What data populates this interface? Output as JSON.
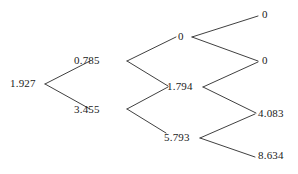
{
  "diagram": {
    "type": "binary-tree",
    "background_color": "#ffffff",
    "line_color": "#2a2a2a",
    "text_color": "#1a1a1a",
    "width": 298,
    "height": 174,
    "nodes": [
      {
        "id": "root",
        "label": "1.927",
        "x": 10,
        "y": 78,
        "anchor": "left",
        "depth": 0
      },
      {
        "id": "n1",
        "label": "0.785",
        "x": 74,
        "y": 55,
        "anchor": "left",
        "depth": 1
      },
      {
        "id": "n2",
        "label": "3.455",
        "x": 74,
        "y": 104,
        "anchor": "left",
        "depth": 1
      },
      {
        "id": "n3",
        "label": "0",
        "x": 178,
        "y": 31,
        "anchor": "left",
        "depth": 2
      },
      {
        "id": "n4",
        "label": "1.794",
        "x": 167,
        "y": 81,
        "anchor": "left",
        "depth": 2
      },
      {
        "id": "n5",
        "label": "5.793",
        "x": 164,
        "y": 132,
        "anchor": "left",
        "depth": 2
      },
      {
        "id": "l1",
        "label": "0",
        "x": 262,
        "y": 9,
        "anchor": "left",
        "depth": 3
      },
      {
        "id": "l2",
        "label": "0",
        "x": 262,
        "y": 55,
        "anchor": "left",
        "depth": 3
      },
      {
        "id": "l3",
        "label": "4.083",
        "x": 258,
        "y": 108,
        "anchor": "left",
        "depth": 3
      },
      {
        "id": "l4",
        "label": "8.634",
        "x": 258,
        "y": 150,
        "anchor": "left",
        "depth": 3
      }
    ],
    "edges": [
      {
        "from": "root",
        "to": "n1",
        "x1": 45,
        "y1": 84,
        "x2": 90,
        "y2": 61
      },
      {
        "from": "root",
        "to": "n2",
        "x1": 45,
        "y1": 84,
        "x2": 90,
        "y2": 109
      },
      {
        "from": "n1",
        "to": "n3",
        "x1": 127,
        "y1": 61,
        "x2": 176,
        "y2": 37
      },
      {
        "from": "n1",
        "to": "n4",
        "x1": 127,
        "y1": 61,
        "x2": 168,
        "y2": 86
      },
      {
        "from": "n2",
        "to": "n4",
        "x1": 127,
        "y1": 109,
        "x2": 168,
        "y2": 87
      },
      {
        "from": "n2",
        "to": "n5",
        "x1": 127,
        "y1": 109,
        "x2": 166,
        "y2": 133
      },
      {
        "from": "n3",
        "to": "l1",
        "x1": 192,
        "y1": 37,
        "x2": 258,
        "y2": 16
      },
      {
        "from": "n3",
        "to": "l2",
        "x1": 192,
        "y1": 37,
        "x2": 258,
        "y2": 61
      },
      {
        "from": "n4",
        "to": "l2",
        "x1": 203,
        "y1": 87,
        "x2": 258,
        "y2": 62
      },
      {
        "from": "n4",
        "to": "l3",
        "x1": 203,
        "y1": 87,
        "x2": 256,
        "y2": 113
      },
      {
        "from": "n5",
        "to": "l3",
        "x1": 200,
        "y1": 138,
        "x2": 255,
        "y2": 114
      },
      {
        "from": "n5",
        "to": "l4",
        "x1": 200,
        "y1": 138,
        "x2": 255,
        "y2": 157
      }
    ]
  }
}
